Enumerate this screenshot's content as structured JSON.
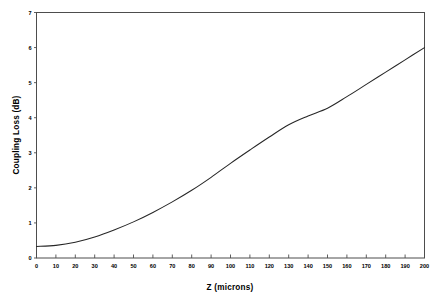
{
  "figure": {
    "background_color": "#ffffff",
    "frame_color": "#4d4d4d",
    "curve_color": "#262626"
  },
  "chart_data": {
    "type": "line",
    "title": "",
    "subtitle": "",
    "xlabel": "Z (microns)",
    "ylabel": "Coupling Loss (dB)",
    "xlim": [
      0,
      200
    ],
    "ylim": [
      0,
      7
    ],
    "grid": false,
    "legend": null,
    "legend_position": "none",
    "xticks": [
      0,
      10,
      20,
      30,
      40,
      50,
      60,
      70,
      80,
      90,
      100,
      110,
      120,
      130,
      140,
      150,
      160,
      170,
      180,
      190,
      200
    ],
    "xtick_labels": [
      "0",
      "10",
      "20",
      "30",
      "40",
      "50",
      "60",
      "70",
      "80",
      "90",
      "100",
      "110",
      "120",
      "130",
      "140",
      "150",
      "160",
      "170",
      "180",
      "190",
      "200"
    ],
    "yticks": [
      0,
      1,
      2,
      3,
      4,
      5,
      6,
      7
    ],
    "ytick_labels": [
      "0",
      "1",
      "2",
      "3",
      "4",
      "5",
      "6",
      "7"
    ],
    "series": [
      {
        "name": "Coupling Loss",
        "x": [
          0,
          10,
          20,
          30,
          40,
          50,
          60,
          70,
          80,
          90,
          100,
          110,
          120,
          130,
          140,
          150,
          160,
          170,
          180,
          190,
          200
        ],
        "values": [
          0.33,
          0.36,
          0.45,
          0.6,
          0.8,
          1.03,
          1.3,
          1.6,
          1.93,
          2.3,
          2.7,
          3.08,
          3.45,
          3.8,
          4.05,
          4.27,
          4.6,
          4.95,
          5.3,
          5.65,
          6.0
        ]
      }
    ],
    "annotations": []
  }
}
